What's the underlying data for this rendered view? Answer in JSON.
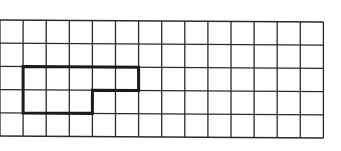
{
  "diagram": {
    "type": "grid-with-outlined-shape",
    "grid": {
      "columns": 14,
      "rows": 5,
      "origin_x": 0,
      "origin_y": 20,
      "cell_width": 23.1,
      "cell_height": 23.2,
      "line_color": "#2a2a2a",
      "line_width": 1.3,
      "skew_right_px": 2
    },
    "shape": {
      "description": "Bold L-shaped outline covering cells: row 2 columns 1-5 and row 3 columns 1-3",
      "stroke_color": "#1a1a1a",
      "stroke_width": 3,
      "vertices_in_cells": [
        [
          1,
          2
        ],
        [
          6,
          2
        ],
        [
          6,
          3
        ],
        [
          4,
          3
        ],
        [
          4,
          4
        ],
        [
          1,
          4
        ]
      ],
      "cell_count": 8
    },
    "background_color": "#ffffff"
  }
}
